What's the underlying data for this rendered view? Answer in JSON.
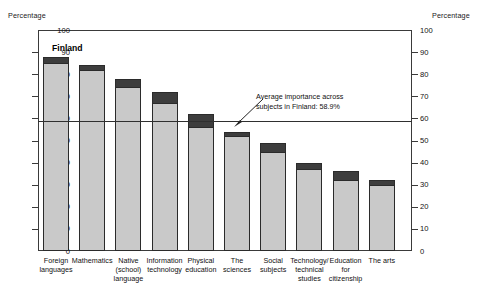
{
  "axis": {
    "left_caption": "Percentage",
    "right_caption": "Percentage",
    "ticks": [
      "100",
      "90",
      "80",
      "70",
      "60",
      "50",
      "40",
      "30",
      "20",
      "10",
      "0"
    ]
  },
  "country_label": "Finland",
  "annotation": {
    "line1": "Average importance across",
    "line2": "subjects in Finland: 58.9%"
  },
  "chart_data": {
    "type": "bar",
    "title": "",
    "subtitle": "",
    "xlabel": "",
    "ylabel": "Percentage",
    "ylim": [
      0,
      100
    ],
    "yticks": [
      0,
      10,
      20,
      30,
      40,
      50,
      60,
      70,
      80,
      90,
      100
    ],
    "grid": false,
    "legend_position": "none",
    "stacked": true,
    "categories": [
      "Foreign languages",
      "Mathematics",
      "Native (school) language",
      "Information technology",
      "Physical education",
      "The sciences",
      "Social subjects",
      "Technology/ technical studies",
      "Education for citizenship",
      "The arts"
    ],
    "category_lines": [
      [
        "Foreign",
        "languages"
      ],
      [
        "Mathematics"
      ],
      [
        "Native",
        "(school)",
        "language"
      ],
      [
        "Information",
        "technology"
      ],
      [
        "Physical",
        "education"
      ],
      [
        "The",
        "sciences"
      ],
      [
        "Social",
        "subjects"
      ],
      [
        "Technology/",
        "technical",
        "studies"
      ],
      [
        "Education",
        "for",
        "citizenship"
      ],
      [
        "The arts"
      ]
    ],
    "series": [
      {
        "name": "Considerable importance (light segment)",
        "color": "#c9c9c9",
        "values": [
          85,
          82,
          74,
          67,
          56,
          52,
          45,
          37,
          32,
          30
        ]
      },
      {
        "name": "Additional share (dark top segment)",
        "color": "#3d3d3d",
        "values": [
          3,
          2,
          4,
          5,
          6,
          2,
          4,
          3,
          4,
          2
        ]
      }
    ],
    "totals": [
      88,
      84,
      78,
      72,
      62,
      54,
      49,
      40,
      36,
      32
    ],
    "reference_line": {
      "label": "Average importance across subjects in Finland: 58.9%",
      "value": 58.9
    }
  }
}
